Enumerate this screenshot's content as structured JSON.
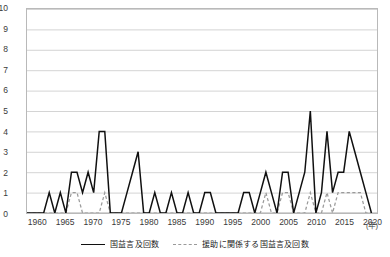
{
  "chart_data": {
    "type": "line",
    "title": "",
    "xlabel": "年",
    "ylabel": "",
    "xlim": [
      1958,
      2021
    ],
    "ylim": [
      0,
      10
    ],
    "grid": true,
    "legend_position": "bottom-center",
    "x_unit_label": "(年)",
    "y_ticks": [
      10,
      9,
      8,
      7,
      6,
      5,
      4,
      3,
      2,
      1,
      0
    ],
    "x_ticks": [
      1960,
      1965,
      1970,
      1975,
      1980,
      1985,
      1990,
      1995,
      2000,
      2005,
      2010,
      2015,
      2020
    ],
    "x": [
      1958,
      1959,
      1960,
      1961,
      1962,
      1963,
      1964,
      1965,
      1966,
      1967,
      1968,
      1969,
      1970,
      1971,
      1972,
      1973,
      1974,
      1975,
      1976,
      1977,
      1978,
      1979,
      1980,
      1981,
      1982,
      1983,
      1984,
      1985,
      1986,
      1987,
      1988,
      1989,
      1990,
      1991,
      1992,
      1993,
      1994,
      1995,
      1996,
      1997,
      1998,
      1999,
      2000,
      2001,
      2002,
      2003,
      2004,
      2005,
      2006,
      2007,
      2008,
      2009,
      2010,
      2011,
      2012,
      2013,
      2014,
      2015,
      2016,
      2017,
      2018,
      2019,
      2020
    ],
    "series": [
      {
        "name": "国益言及回数",
        "style": "solid",
        "color": "#101010",
        "values": [
          0,
          0,
          0,
          0,
          1,
          0,
          1,
          0,
          2,
          2,
          1,
          2,
          1,
          4,
          4,
          0,
          0,
          0,
          1,
          2,
          3,
          0,
          0,
          1,
          0,
          0,
          1,
          0,
          0,
          1,
          0,
          0,
          1,
          1,
          0,
          0,
          0,
          0,
          0,
          1,
          1,
          0,
          1,
          2,
          1,
          0,
          2,
          2,
          0,
          1,
          2,
          5,
          0,
          1,
          4,
          1,
          2,
          2,
          4,
          3,
          2,
          1,
          0
        ]
      },
      {
        "name": "援助に関係する国益言及回数",
        "style": "dashed",
        "color": "#9a9a9a",
        "values": [
          0,
          0,
          0,
          0,
          0,
          0,
          0,
          0,
          1,
          1,
          0,
          0,
          0,
          0,
          1,
          0,
          0,
          0,
          0,
          0,
          0,
          0,
          0,
          0,
          0,
          0,
          0,
          0,
          0,
          0,
          0,
          0,
          0,
          0,
          0,
          0,
          0,
          0,
          0,
          0,
          0,
          0,
          0,
          1,
          0,
          0,
          1,
          1,
          0,
          0,
          0,
          1,
          0,
          0,
          1,
          0,
          1,
          1,
          1,
          1,
          1,
          0,
          0
        ]
      }
    ]
  },
  "legend": {
    "items": [
      {
        "label": "国益言及回数",
        "style": "solid"
      },
      {
        "label": "援助に関係する国益言及回数",
        "style": "dashed"
      }
    ]
  },
  "colors": {
    "series_primary": "#101010",
    "series_secondary": "#9a9a9a",
    "gridline": "#d4d4d4",
    "frame": "#b9b9b9",
    "tick_text": "#3a3a3a",
    "background": "#ffffff"
  }
}
